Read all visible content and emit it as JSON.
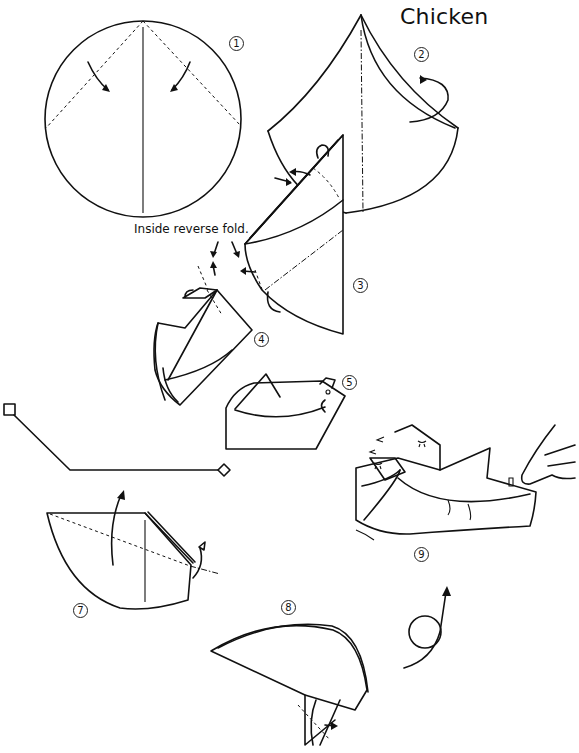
{
  "title": "Chicken",
  "annotation": "Inside reverse fold.",
  "steps": [
    {
      "label": "①",
      "number": 1
    },
    {
      "label": "②",
      "number": 2
    },
    {
      "label": "③",
      "number": 3
    },
    {
      "label": "④",
      "number": 4
    },
    {
      "label": "⑤",
      "number": 5
    },
    {
      "label": "⑦",
      "number": 7
    },
    {
      "label": "⑧",
      "number": 8
    },
    {
      "label": "⑨",
      "number": 9
    }
  ],
  "figures": [
    {
      "step": 1,
      "shape": "circle with center crease and two dashed valley folds"
    },
    {
      "step": 2,
      "shape": "cone with dash-dot mountain fold"
    },
    {
      "step": 3,
      "shape": "folded cone with inside reverse folds"
    },
    {
      "step": 4,
      "shape": "partially formed chicken"
    },
    {
      "step": 5,
      "shape": "finished chicken"
    },
    {
      "step": 6,
      "shape": "bent line with square and diamond ends"
    },
    {
      "step": 7,
      "shape": "half circle with dashed fold line"
    },
    {
      "step": 8,
      "shape": "half moon base"
    },
    {
      "step": 9,
      "shape": "rocking chickens pushed by finger"
    }
  ],
  "colors": {
    "line": "#111111",
    "background": "#ffffff"
  }
}
